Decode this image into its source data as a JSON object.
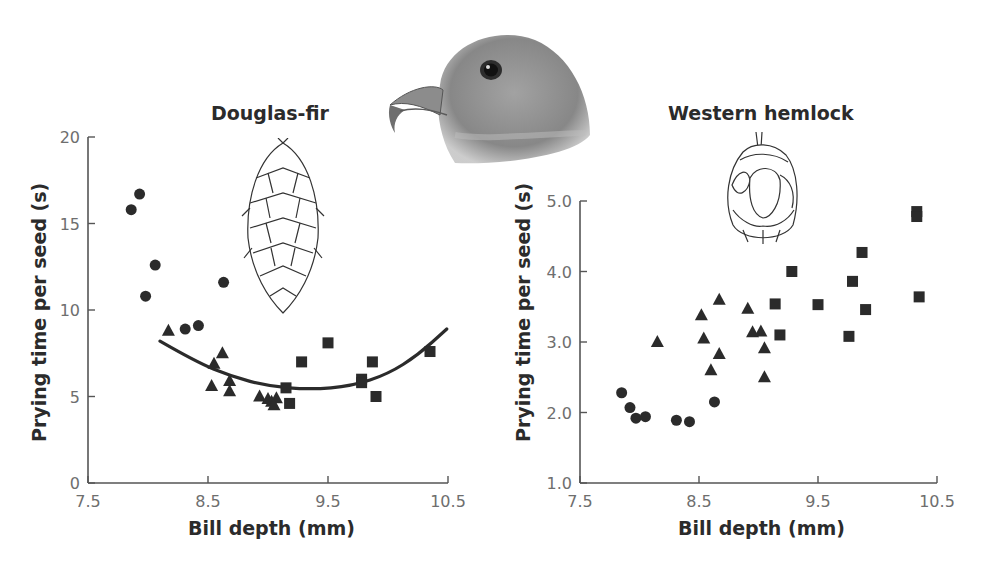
{
  "figure": {
    "panels": [
      {
        "title": "Douglas-fir",
        "xlabel": "Bill depth (mm)",
        "ylabel": "Prying time per seed (s)"
      },
      {
        "title": "Western hemlock",
        "xlabel": "Bill depth (mm)",
        "ylabel": "Prying time per seed (s)"
      }
    ],
    "illustrations": [
      "crossbill-head",
      "douglas-fir-cone",
      "western-hemlock-cone"
    ],
    "marker_color": "#2b2b2b",
    "axis_color": "#555555"
  },
  "chart_data": [
    {
      "type": "scatter",
      "title": "Douglas-fir",
      "xlabel": "Bill depth (mm)",
      "ylabel": "Prying time per seed (s)",
      "xlim": [
        7.5,
        10.5
      ],
      "ylim": [
        0,
        20
      ],
      "xticks": [
        7.5,
        8.5,
        9.5,
        10.5
      ],
      "yticks": [
        0,
        5,
        10,
        15,
        20
      ],
      "xtick_labels": [
        "7.5",
        "8.5",
        "9.5",
        "10.5"
      ],
      "ytick_labels": [
        "0",
        "5",
        "10",
        "15",
        "20"
      ],
      "grid": false,
      "legend": null,
      "series": [
        {
          "name": "circles",
          "marker": "circle",
          "points": [
            [
              7.86,
              15.8
            ],
            [
              7.93,
              16.7
            ],
            [
              8.06,
              12.6
            ],
            [
              7.98,
              10.8
            ],
            [
              8.63,
              11.6
            ],
            [
              8.31,
              8.9
            ],
            [
              8.42,
              9.1
            ]
          ]
        },
        {
          "name": "triangles",
          "marker": "triangle",
          "points": [
            [
              8.17,
              8.8
            ],
            [
              8.62,
              7.5
            ],
            [
              8.55,
              6.9
            ],
            [
              8.53,
              5.6
            ],
            [
              8.68,
              5.9
            ],
            [
              8.68,
              5.3
            ],
            [
              8.93,
              5.0
            ],
            [
              9.0,
              4.85
            ],
            [
              9.03,
              4.7
            ],
            [
              9.07,
              4.9
            ],
            [
              9.05,
              4.5
            ]
          ]
        },
        {
          "name": "squares",
          "marker": "square",
          "points": [
            [
              9.15,
              5.5
            ],
            [
              9.18,
              4.6
            ],
            [
              9.28,
              7.0
            ],
            [
              9.5,
              8.1
            ],
            [
              9.78,
              6.0
            ],
            [
              9.78,
              5.8
            ],
            [
              9.87,
              7.0
            ],
            [
              9.9,
              5.0
            ],
            [
              10.35,
              7.6
            ]
          ]
        }
      ],
      "fit_curve": {
        "type": "quadratic",
        "points": [
          [
            8.1,
            8.2
          ],
          [
            8.4,
            7.0
          ],
          [
            8.7,
            6.15
          ],
          [
            9.0,
            5.6
          ],
          [
            9.35,
            5.4
          ],
          [
            9.7,
            5.6
          ],
          [
            10.0,
            6.3
          ],
          [
            10.25,
            7.4
          ],
          [
            10.49,
            8.9
          ]
        ]
      }
    },
    {
      "type": "scatter",
      "title": "Western hemlock",
      "xlabel": "Bill depth (mm)",
      "ylabel": "Prying time per seed (s)",
      "xlim": [
        7.5,
        10.5
      ],
      "ylim": [
        1.0,
        5.0
      ],
      "xticks": [
        7.5,
        8.5,
        9.5,
        10.5
      ],
      "yticks": [
        1.0,
        2.0,
        3.0,
        4.0,
        5.0
      ],
      "xtick_labels": [
        "7.5",
        "8.5",
        "9.5",
        "10.5"
      ],
      "ytick_labels": [
        "1.0",
        "2.0",
        "3.0",
        "4.0",
        "5.0"
      ],
      "grid": false,
      "legend": null,
      "series": [
        {
          "name": "circles",
          "marker": "circle",
          "points": [
            [
              7.85,
              2.28
            ],
            [
              7.92,
              2.07
            ],
            [
              7.97,
              1.92
            ],
            [
              8.05,
              1.94
            ],
            [
              8.31,
              1.89
            ],
            [
              8.42,
              1.87
            ],
            [
              8.63,
              2.15
            ]
          ]
        },
        {
          "name": "triangles",
          "marker": "triangle",
          "points": [
            [
              8.15,
              3.0
            ],
            [
              8.52,
              3.38
            ],
            [
              8.54,
              3.05
            ],
            [
              8.67,
              3.6
            ],
            [
              8.67,
              2.83
            ],
            [
              8.6,
              2.6
            ],
            [
              8.91,
              3.47
            ],
            [
              8.95,
              3.14
            ],
            [
              9.02,
              3.15
            ],
            [
              9.05,
              2.91
            ],
            [
              9.05,
              2.5
            ]
          ]
        },
        {
          "name": "squares",
          "marker": "square",
          "points": [
            [
              9.28,
              4.0
            ],
            [
              9.14,
              3.54
            ],
            [
              9.18,
              3.1
            ],
            [
              9.5,
              3.53
            ],
            [
              9.87,
              4.27
            ],
            [
              9.79,
              3.86
            ],
            [
              9.9,
              3.46
            ],
            [
              9.76,
              3.08
            ],
            [
              10.35,
              3.64
            ],
            [
              10.33,
              4.85
            ],
            [
              10.33,
              4.78
            ]
          ]
        }
      ],
      "fit_curve": null
    }
  ]
}
